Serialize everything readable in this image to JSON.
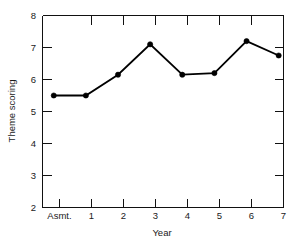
{
  "chart_data": {
    "type": "line",
    "title": "",
    "subtitle": "",
    "xlabel": "Year",
    "ylabel": "Theme scoring",
    "categories": [
      "Asmt.",
      "1",
      "2",
      "3",
      "4",
      "5",
      "6",
      "7"
    ],
    "x": [
      0,
      1,
      2,
      3,
      4,
      5,
      6,
      7
    ],
    "values": [
      5.5,
      5.5,
      6.15,
      7.1,
      6.15,
      6.2,
      7.2,
      6.75
    ],
    "series": [
      {
        "name": "Theme scoring",
        "values": [
          5.5,
          5.5,
          6.15,
          7.1,
          6.15,
          6.2,
          7.2,
          6.75
        ]
      }
    ],
    "xlim": [
      -0.35,
      7.15
    ],
    "ylim": [
      2,
      8
    ],
    "yticks": [
      2,
      3,
      4,
      5,
      6,
      7,
      8
    ],
    "ytick_labels": [
      "2",
      "3",
      "4",
      "5",
      "6",
      "7",
      "8"
    ],
    "xticks": [
      0,
      1,
      2,
      3,
      4,
      5,
      6,
      7
    ],
    "xtick_labels": [
      "Asmt.",
      "1",
      "2",
      "3",
      "4",
      "5",
      "6",
      "7"
    ],
    "grid": false,
    "legend": false,
    "legend_position": "none",
    "marker": "filled-circle",
    "line_color": "#000000",
    "marker_color": "#000000",
    "axis_color": "#111111",
    "background_color": "#ffffff",
    "tick_direction": "in",
    "annotations": []
  },
  "axes": {
    "y_title": "Theme scoring",
    "x_title": "Year"
  }
}
